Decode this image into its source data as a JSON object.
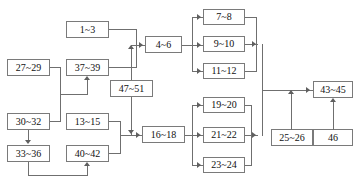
{
  "diagram": {
    "type": "flow-network",
    "background_color": "#ffffff",
    "box_border_color": "#7a7a7a",
    "line_color": "#6f6f6f",
    "text_color": "#111111",
    "nodes": [
      {
        "id": "n1_3",
        "label": "1~3",
        "x": 66,
        "y": 21,
        "w": 43,
        "h": 17
      },
      {
        "id": "n27_29",
        "label": "27~29",
        "x": 7,
        "y": 59,
        "w": 43,
        "h": 17
      },
      {
        "id": "n37_39",
        "label": "37~39",
        "x": 66,
        "y": 59,
        "w": 43,
        "h": 17
      },
      {
        "id": "n4_6",
        "label": "4~6",
        "x": 145,
        "y": 36,
        "w": 37,
        "h": 17
      },
      {
        "id": "n7_8",
        "label": "7~8",
        "x": 203,
        "y": 9,
        "w": 42,
        "h": 16
      },
      {
        "id": "n9_10",
        "label": "9~10",
        "x": 203,
        "y": 36,
        "w": 42,
        "h": 16
      },
      {
        "id": "n11_12",
        "label": "11~12",
        "x": 203,
        "y": 63,
        "w": 42,
        "h": 16
      },
      {
        "id": "n47_51",
        "label": "47~51",
        "x": 110,
        "y": 80,
        "w": 43,
        "h": 17
      },
      {
        "id": "n30_32",
        "label": "30~32",
        "x": 7,
        "y": 113,
        "w": 43,
        "h": 17
      },
      {
        "id": "n13_15",
        "label": "13~15",
        "x": 66,
        "y": 113,
        "w": 43,
        "h": 17
      },
      {
        "id": "n33_36",
        "label": "33~36",
        "x": 7,
        "y": 145,
        "w": 43,
        "h": 17
      },
      {
        "id": "n40_42",
        "label": "40~42",
        "x": 66,
        "y": 145,
        "w": 43,
        "h": 17
      },
      {
        "id": "n16_18",
        "label": "16~18",
        "x": 142,
        "y": 126,
        "w": 43,
        "h": 17
      },
      {
        "id": "n19_20",
        "label": "19~20",
        "x": 203,
        "y": 97,
        "w": 42,
        "h": 16
      },
      {
        "id": "n21_22",
        "label": "21~22",
        "x": 203,
        "y": 127,
        "w": 42,
        "h": 16
      },
      {
        "id": "n23_24",
        "label": "23~24",
        "x": 203,
        "y": 157,
        "w": 42,
        "h": 16
      },
      {
        "id": "n25_26",
        "label": "25~26",
        "x": 271,
        "y": 129,
        "w": 42,
        "h": 17
      },
      {
        "id": "n43_45",
        "label": "43~45",
        "x": 313,
        "y": 81,
        "w": 40,
        "h": 17
      },
      {
        "id": "n46",
        "label": "46",
        "x": 313,
        "y": 129,
        "w": 40,
        "h": 17
      }
    ],
    "edges": [
      {
        "from": "1~3",
        "to": "4~6"
      },
      {
        "from": "37~39",
        "to": "4~6"
      },
      {
        "from": "47~51",
        "to": "4~6"
      },
      {
        "from": "47~51",
        "to": "16~18"
      },
      {
        "from": "27~29",
        "to": "37~39"
      },
      {
        "from": "30~32",
        "to": "37~39"
      },
      {
        "from": "30~32",
        "to": "33~36"
      },
      {
        "from": "33~36",
        "to": "40~42"
      },
      {
        "from": "13~15",
        "to": "16~18"
      },
      {
        "from": "40~42",
        "to": "16~18"
      },
      {
        "from": "4~6",
        "to": "7~8"
      },
      {
        "from": "4~6",
        "to": "9~10"
      },
      {
        "from": "4~6",
        "to": "11~12"
      },
      {
        "from": "7~8",
        "to": "43~45"
      },
      {
        "from": "9~10",
        "to": "43~45"
      },
      {
        "from": "11~12",
        "to": "43~45"
      },
      {
        "from": "16~18",
        "to": "19~20"
      },
      {
        "from": "16~18",
        "to": "21~22"
      },
      {
        "from": "16~18",
        "to": "23~24"
      },
      {
        "from": "19~20",
        "to": "43~45"
      },
      {
        "from": "21~22",
        "to": "43~45"
      },
      {
        "from": "23~24",
        "to": "43~45"
      },
      {
        "from": "25~26",
        "to": "43~45"
      },
      {
        "from": "46",
        "to": "43~45"
      }
    ]
  }
}
